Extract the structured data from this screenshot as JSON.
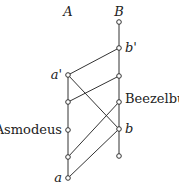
{
  "columns": [
    {
      "id": "A",
      "label": "A"
    },
    {
      "id": "B",
      "label": "B"
    }
  ],
  "nodes": [
    {
      "id": "A1",
      "column": "A",
      "level": 1,
      "label": "a'"
    },
    {
      "id": "A2",
      "column": "A",
      "level": 2,
      "label": ""
    },
    {
      "id": "A3",
      "column": "A",
      "level": 3,
      "label": "Asmodeus"
    },
    {
      "id": "A4",
      "column": "A",
      "level": 4,
      "label": ""
    },
    {
      "id": "A5",
      "column": "A",
      "level": 5,
      "label": "a"
    },
    {
      "id": "B0",
      "column": "B",
      "level": 0,
      "label": ""
    },
    {
      "id": "B1",
      "column": "B",
      "level": 1,
      "label": "b'"
    },
    {
      "id": "B2",
      "column": "B",
      "level": 2,
      "label": ""
    },
    {
      "id": "B3",
      "column": "B",
      "level": 3,
      "label": "Beezelbub"
    },
    {
      "id": "B4",
      "column": "B",
      "level": 4,
      "label": "b"
    },
    {
      "id": "B5",
      "column": "B",
      "level": 5,
      "label": ""
    }
  ],
  "edges": [
    [
      "A1",
      "A2"
    ],
    [
      "A2",
      "A3"
    ],
    [
      "A3",
      "A4"
    ],
    [
      "A4",
      "A5"
    ],
    [
      "B0",
      "B1"
    ],
    [
      "B1",
      "B2"
    ],
    [
      "B2",
      "B3"
    ],
    [
      "B3",
      "B4"
    ],
    [
      "B4",
      "B5"
    ],
    [
      "A1",
      "B1"
    ],
    [
      "A1",
      "B4"
    ],
    [
      "A2",
      "B2"
    ],
    [
      "A4",
      "B3"
    ],
    [
      "A5",
      "B4"
    ]
  ]
}
